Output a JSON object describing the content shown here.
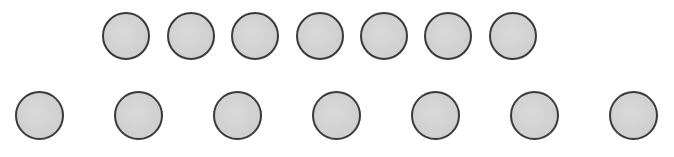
{
  "diagram": {
    "style": {
      "fill": "#d0d0d0",
      "stroke": "#3a3a3a",
      "background": "#ffffff"
    },
    "rows": [
      {
        "name": "top-row",
        "count": 7,
        "diameter": 48,
        "center_y": 36,
        "centers_x": [
          126,
          191,
          255,
          320,
          384,
          448,
          513
        ]
      },
      {
        "name": "bottom-row",
        "count": 7,
        "diameter": 49,
        "center_y": 115,
        "centers_x": [
          39,
          138,
          237,
          336,
          435,
          534,
          633
        ]
      }
    ]
  }
}
